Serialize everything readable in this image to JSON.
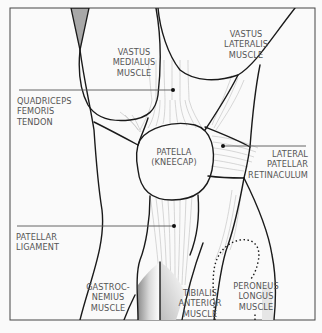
{
  "diagram": {
    "colors": {
      "background": "#fafafa",
      "outline": "#1a1a1a",
      "fiber": "#b5b5b5",
      "frame": "#444444",
      "text": "#555555",
      "bone_shade": "#9a9a9a"
    },
    "labels": {
      "vastus_medialus": "VASTUS\nMEDIALUS\nMUSCLE",
      "vastus_lateralis": "VASTUS\nLATERALIS\nMUSCLE",
      "quadriceps_tendon": "QUADRICEPS\nFEMORIS\nTENDON",
      "patella": "PATELLA\n(KNEECAP)",
      "lateral_retinaculum": "LATERAL\nPATELLAR\nRETINACULUM",
      "patellar_ligament": "PATELLAR\nLIGAMENT",
      "gastrocnemius": "GASTROC-\nNEMIUS\nMUSCLE",
      "tibialis_anterior": "TIBIALIS\nANTERIOR\nMUSCLE",
      "peroneus_longus": "PERONEUS\nLONGUS\nMUSCLE"
    }
  }
}
